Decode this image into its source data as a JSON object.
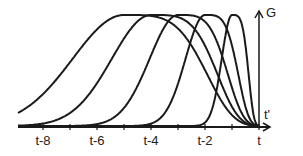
{
  "chart_data": {
    "type": "line",
    "title": "",
    "xlabel": "t'",
    "ylabel": "G",
    "x_tick_labels": [
      "t-8",
      "t-6",
      "t-4",
      "t-2",
      "t"
    ],
    "x_tick_values": [
      -8,
      -7,
      -6,
      -5,
      -4,
      -3,
      -2,
      -1,
      0
    ],
    "labeled_ticks": [
      -8,
      -6,
      -4,
      -2,
      0
    ],
    "xlim": [
      -8.8,
      0.6
    ],
    "ylim": [
      0,
      1
    ],
    "grid": false,
    "legend": null,
    "series": [
      {
        "name": "curve-1",
        "peak_x": -5,
        "peak_y": 1.0,
        "width": 1.9
      },
      {
        "name": "curve-2",
        "peak_x": -4,
        "peak_y": 1.0,
        "width": 1.45
      },
      {
        "name": "curve-3",
        "peak_x": -3,
        "peak_y": 1.0,
        "width": 1.05
      },
      {
        "name": "curve-4",
        "peak_x": -2,
        "peak_y": 1.0,
        "width": 0.72
      },
      {
        "name": "curve-5",
        "peak_x": -1,
        "peak_y": 1.0,
        "width": 0.38
      }
    ],
    "annotation": "Kernels G(t, t') for successive delays, narrowing as t' approaches t"
  },
  "labels": {
    "y_axis": "G",
    "x_axis": "t'",
    "ticks": [
      "t-8",
      "t-6",
      "t-4",
      "t-2",
      "t"
    ]
  },
  "colors": {
    "ink": "#1a1a1a",
    "background": "#ffffff"
  }
}
